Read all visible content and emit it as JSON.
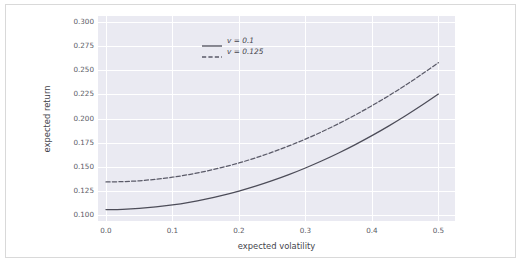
{
  "chart_data": {
    "type": "line",
    "title": "",
    "xlabel": "expected volatility",
    "ylabel": "expected return",
    "xlim": [
      -0.012,
      0.525
    ],
    "ylim": [
      0.0935,
      0.3065
    ],
    "xticks": [
      "0.0",
      "0.1",
      "0.2",
      "0.3",
      "0.4",
      "0.5"
    ],
    "xtick_values": [
      0.0,
      0.1,
      0.2,
      0.3,
      0.4,
      0.5
    ],
    "yticks": [
      "0.100",
      "0.125",
      "0.150",
      "0.175",
      "0.200",
      "0.225",
      "0.250",
      "0.275",
      "0.300"
    ],
    "ytick_values": [
      0.1,
      0.125,
      0.15,
      0.175,
      0.2,
      0.225,
      0.25,
      0.275,
      0.3
    ],
    "grid": true,
    "legend_position": "upper left",
    "axes_facecolor": "#eaeaf2",
    "grid_color": "#ffffff",
    "series": [
      {
        "name": "v = 0.1",
        "linestyle": "solid",
        "color": "#4c4c58",
        "x": [
          0.0,
          0.025,
          0.05,
          0.075,
          0.1,
          0.125,
          0.15,
          0.175,
          0.2,
          0.225,
          0.25,
          0.275,
          0.3,
          0.325,
          0.35,
          0.375,
          0.4,
          0.425,
          0.45,
          0.475,
          0.5
        ],
        "y": [
          0.1054,
          0.1057,
          0.1066,
          0.1081,
          0.1102,
          0.1129,
          0.1162,
          0.1201,
          0.1246,
          0.1297,
          0.1354,
          0.1417,
          0.1486,
          0.1561,
          0.1642,
          0.1729,
          0.1822,
          0.1921,
          0.2026,
          0.2137,
          0.2254
        ]
      },
      {
        "name": "v = 0.125",
        "linestyle": "dashed",
        "color": "#5a5a68",
        "x": [
          0.0,
          0.025,
          0.05,
          0.075,
          0.1,
          0.125,
          0.15,
          0.175,
          0.2,
          0.225,
          0.25,
          0.275,
          0.3,
          0.325,
          0.35,
          0.375,
          0.4,
          0.425,
          0.45,
          0.475,
          0.5
        ],
        "y": [
          0.1341,
          0.1344,
          0.1353,
          0.1369,
          0.139,
          0.1418,
          0.1452,
          0.1492,
          0.1538,
          0.1591,
          0.165,
          0.1715,
          0.1786,
          0.1863,
          0.1947,
          0.2037,
          0.2133,
          0.2235,
          0.2344,
          0.2459,
          0.258
        ]
      }
    ]
  },
  "legend": {
    "entries": [
      {
        "label": "v = 0.1"
      },
      {
        "label": "v = 0.125"
      }
    ]
  }
}
